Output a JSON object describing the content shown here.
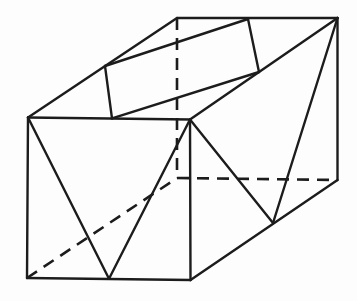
{
  "figure": {
    "name": "parallelepiped-with-inscribed-triangles-and-parallelogram",
    "canvas": {
      "width": 357,
      "height": 301,
      "background": "#fdfdfd"
    },
    "style": {
      "stroke_color": "#1c1c1c",
      "solid_stroke_width": 2.4,
      "dashed_stroke_width": 2.6,
      "dash_pattern": "12,8",
      "linecap": "round"
    },
    "vertices": {
      "A": [
        28,
        117.5
      ],
      "B": [
        190,
        119.5
      ],
      "C": [
        190.5,
        280
      ],
      "D": [
        27,
        278
      ],
      "A2": [
        177,
        18
      ],
      "B2": [
        337.5,
        18
      ],
      "C2": [
        337.5,
        180
      ],
      "D2": [
        177,
        178
      ],
      "M": [
        109,
        278.8
      ],
      "N": [
        273,
        223
      ],
      "P1": [
        105,
        66
      ],
      "P2": [
        112,
        118.3
      ],
      "P3": [
        259,
        72
      ],
      "P4": [
        248,
        19
      ]
    },
    "edges": [
      {
        "id": "front-top-edge",
        "from": "A",
        "to": "B",
        "style": "solid"
      },
      {
        "id": "front-right-edge",
        "from": "B",
        "to": "C",
        "style": "solid"
      },
      {
        "id": "front-bottom-edge",
        "from": "C",
        "to": "D",
        "style": "solid"
      },
      {
        "id": "front-left-edge",
        "from": "D",
        "to": "A",
        "style": "solid"
      },
      {
        "id": "top-left-depth-edge",
        "from": "A",
        "to": "A2",
        "style": "solid"
      },
      {
        "id": "back-top-edge",
        "from": "A2",
        "to": "B2",
        "style": "solid"
      },
      {
        "id": "top-right-depth-edge",
        "from": "B",
        "to": "B2",
        "style": "solid"
      },
      {
        "id": "back-right-edge",
        "from": "B2",
        "to": "C2",
        "style": "solid"
      },
      {
        "id": "bottom-right-depth-edge",
        "from": "C",
        "to": "C2",
        "style": "solid"
      },
      {
        "id": "hidden-back-left-edge",
        "from": "A2",
        "to": "D2",
        "style": "dashed"
      },
      {
        "id": "hidden-back-bottom-edge",
        "from": "D2",
        "to": "C2",
        "style": "dashed"
      },
      {
        "id": "hidden-bottom-left-depth-edge",
        "from": "D",
        "to": "D2",
        "style": "dashed"
      },
      {
        "id": "front-triangle-left-side",
        "from": "A",
        "to": "M",
        "style": "solid"
      },
      {
        "id": "front-triangle-right-side",
        "from": "M",
        "to": "B",
        "style": "solid"
      },
      {
        "id": "right-triangle-left-side",
        "from": "B",
        "to": "N",
        "style": "solid"
      },
      {
        "id": "right-triangle-right-side",
        "from": "N",
        "to": "B2",
        "style": "solid"
      },
      {
        "id": "top-parallelogram-top-side",
        "from": "P1",
        "to": "P4",
        "style": "solid"
      },
      {
        "id": "top-parallelogram-right-side",
        "from": "P4",
        "to": "P3",
        "style": "solid"
      },
      {
        "id": "top-parallelogram-bottom-side",
        "from": "P3",
        "to": "P2",
        "style": "solid"
      },
      {
        "id": "top-parallelogram-left-side",
        "from": "P2",
        "to": "P1",
        "style": "solid"
      }
    ]
  }
}
